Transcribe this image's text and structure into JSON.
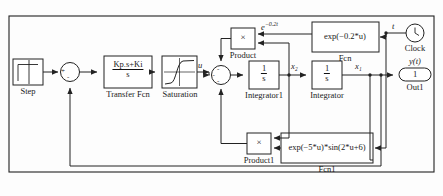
{
  "diagram": {
    "type": "simulink-block-diagram",
    "border_color": "#222222",
    "line_color": "#222222",
    "block_fill": "#ffffff",
    "background": "#fdfdfd"
  },
  "blocks": {
    "step": {
      "caption": "Step",
      "icon": "step-signal-icon"
    },
    "sum1": {
      "caption": "",
      "icon": "sum-junction-icon",
      "signs": [
        "+",
        "-"
      ]
    },
    "transfer_fcn": {
      "numerator": "Kp.s+Ki",
      "denominator": "s",
      "caption": "Transfer Fcn"
    },
    "saturation": {
      "caption": "Saturation",
      "icon": "saturation-curve-icon"
    },
    "sum2": {
      "caption": "",
      "icon": "sum-junction-icon",
      "signs": [
        "-",
        "-",
        "-"
      ]
    },
    "integrator1": {
      "numerator": "1",
      "denominator": "s",
      "caption": "Integrator1"
    },
    "integrator": {
      "numerator": "1",
      "denominator": "s",
      "caption": "Integrator"
    },
    "product": {
      "symbol": "×",
      "caption": "Product"
    },
    "product1": {
      "symbol": "×",
      "caption": "Product1"
    },
    "fcn": {
      "expression": "exp(−0.2*u)",
      "caption": "Fcn"
    },
    "fcn1": {
      "expression": "exp(−5*u)*sin(2*u+6)",
      "caption": "Fcn1"
    },
    "clock": {
      "caption": "Clock",
      "icon": "clock-icon"
    },
    "out1": {
      "caption": "Out1",
      "port_number": "1",
      "icon": "output-port-icon"
    }
  },
  "signal_labels": {
    "u": "u",
    "x2": "x₂",
    "x1": "x₁",
    "t": "t",
    "y_of_t": "y(t)",
    "exp_decay_base": "e",
    "exp_decay_exponent": "−0.2t"
  }
}
